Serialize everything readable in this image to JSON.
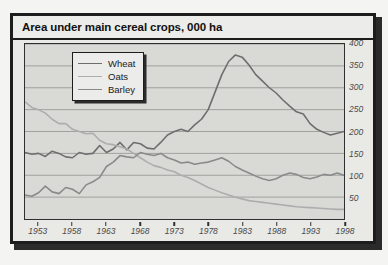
{
  "chart_data": {
    "type": "line",
    "title": "Area under main cereal crops, 000 ha",
    "xlabel": "",
    "ylabel": "",
    "ylim": [
      0,
      400
    ],
    "yticks": [
      400,
      350,
      300,
      250,
      200,
      150,
      100,
      50
    ],
    "xlim": [
      1951,
      1998
    ],
    "xticks": [
      1953,
      1958,
      1963,
      1968,
      1973,
      1978,
      1983,
      1988,
      1993,
      1998
    ],
    "grid": true,
    "legend_position": "upper-left",
    "x": [
      1951,
      1952,
      1953,
      1954,
      1955,
      1956,
      1957,
      1958,
      1959,
      1960,
      1961,
      1962,
      1963,
      1964,
      1965,
      1966,
      1967,
      1968,
      1969,
      1970,
      1971,
      1972,
      1973,
      1974,
      1975,
      1976,
      1977,
      1978,
      1979,
      1980,
      1981,
      1982,
      1983,
      1984,
      1985,
      1986,
      1987,
      1988,
      1989,
      1990,
      1991,
      1992,
      1993,
      1994,
      1995,
      1996,
      1997,
      1998
    ],
    "series": [
      {
        "name": "Wheat",
        "color": "#6e6e6e",
        "values": [
          152,
          148,
          150,
          143,
          155,
          150,
          142,
          140,
          152,
          148,
          150,
          168,
          152,
          160,
          175,
          158,
          175,
          172,
          162,
          160,
          175,
          192,
          200,
          205,
          200,
          215,
          228,
          250,
          290,
          330,
          360,
          375,
          370,
          352,
          330,
          315,
          300,
          288,
          272,
          258,
          245,
          240,
          218,
          205,
          198,
          192,
          196,
          200
        ]
      },
      {
        "name": "Oats",
        "color": "#adadad",
        "values": [
          268,
          255,
          250,
          242,
          228,
          218,
          218,
          205,
          200,
          195,
          196,
          180,
          172,
          170,
          165,
          160,
          150,
          140,
          130,
          122,
          118,
          112,
          108,
          100,
          95,
          88,
          80,
          72,
          66,
          60,
          55,
          50,
          46,
          42,
          40,
          38,
          36,
          34,
          32,
          30,
          28,
          27,
          26,
          25,
          24,
          23,
          22,
          22
        ]
      },
      {
        "name": "Barley",
        "color": "#8a8a8a",
        "values": [
          55,
          52,
          60,
          75,
          62,
          58,
          72,
          68,
          58,
          78,
          85,
          95,
          120,
          130,
          145,
          142,
          140,
          152,
          148,
          145,
          150,
          140,
          135,
          128,
          130,
          125,
          128,
          130,
          135,
          140,
          132,
          120,
          112,
          105,
          98,
          92,
          88,
          92,
          100,
          105,
          102,
          95,
          92,
          96,
          102,
          100,
          105,
          100
        ]
      }
    ]
  }
}
